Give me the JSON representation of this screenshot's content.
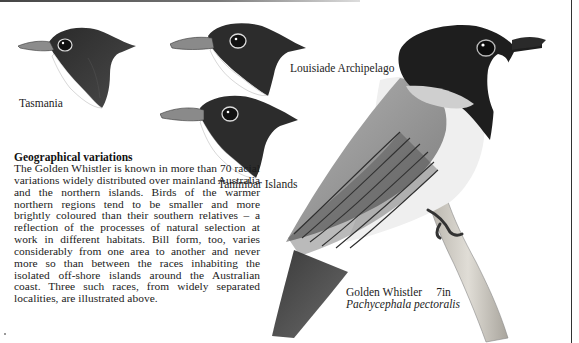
{
  "page": {
    "decor": {
      "top_rule": true,
      "right_rule": true
    }
  },
  "illustrations": {
    "heads": [
      {
        "id": "tasmania",
        "label": "Tasmania"
      },
      {
        "id": "louisiade",
        "label": "Louisiade Archipelago"
      },
      {
        "id": "tanimbar",
        "label": "Tanimbar Islands"
      }
    ],
    "main_bird": {
      "common_name": "Golden Whistler",
      "size": "7in",
      "latin_name": "Pachycephala pectoralis"
    }
  },
  "article": {
    "heading": "Geographical variations",
    "body": "The Golden Whistler is known in more than 70 racial variations widely distributed over mainland Australia and the northern islands. Birds of the warmer northern regions tend to be smaller and more brightly coloured than their southern relatives – a reflection of the processes of natural selection at work in different habitats. Bill form, too, varies considerably from one area to another and never more so than between the races inhabiting the isolated off-shore islands around the Australian coast. Three such races, from widely separated localities, are illustrated above."
  },
  "colors": {
    "ink": "#222222",
    "paper": "#ffffff",
    "head_dark": "#1e1e1e",
    "wing_grey": "#9a9a9a",
    "branch": "#c8c4bc"
  }
}
